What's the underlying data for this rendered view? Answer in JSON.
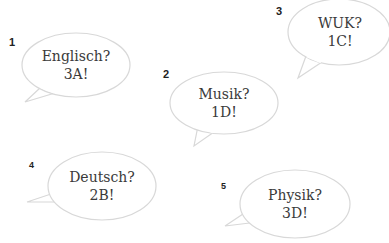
{
  "bubbles": [
    {
      "number": "1",
      "question": "Englisch?",
      "answer": "3A!"
    },
    {
      "number": "2",
      "question": "Musik?",
      "answer": "1D!"
    },
    {
      "number": "3",
      "question": "WUK?",
      "answer": "1C!"
    },
    {
      "number": "4",
      "question": "Deutsch?",
      "answer": "2B!"
    },
    {
      "number": "5",
      "question": "Physik?",
      "answer": "3D!"
    }
  ],
  "colors": {
    "bubble_stroke": "#d8d8d8",
    "bubble_fill": "#ffffff",
    "text": "#3a3a3a",
    "number": "#222222"
  }
}
